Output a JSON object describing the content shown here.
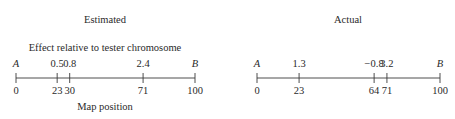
{
  "panels": [
    {
      "title": "Estimated",
      "subtitle": "Effect relative to tester chromosome",
      "xlabel": "Map position",
      "end_labels": [
        "A",
        "B"
      ],
      "x0": 16,
      "x1": 195,
      "markers": [
        {
          "pos": 0,
          "label": "0",
          "effect": ""
        },
        {
          "pos": 23,
          "label": "23",
          "effect": "0.5"
        },
        {
          "pos": 30,
          "label": "30",
          "effect": "0.8"
        },
        {
          "pos": 71,
          "label": "71",
          "effect": "2.4"
        },
        {
          "pos": 100,
          "label": "100",
          "effect": ""
        }
      ]
    },
    {
      "title": "Actual",
      "subtitle": "",
      "xlabel": "",
      "end_labels": [
        "A",
        "B"
      ],
      "x0": 257,
      "x1": 440,
      "markers": [
        {
          "pos": 0,
          "label": "0",
          "effect": ""
        },
        {
          "pos": 23,
          "label": "23",
          "effect": "1.3"
        },
        {
          "pos": 64,
          "label": "64",
          "effect": "−0.8"
        },
        {
          "pos": 71,
          "label": "71",
          "effect": "3.2"
        },
        {
          "pos": 100,
          "label": "100",
          "effect": ""
        }
      ]
    }
  ]
}
